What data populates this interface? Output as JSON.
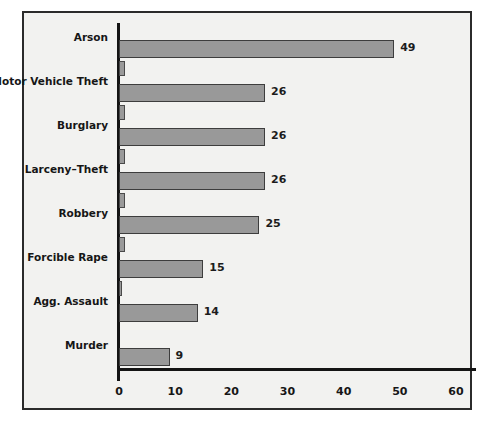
{
  "chart_data": {
    "type": "bar",
    "orientation": "horizontal",
    "title": "",
    "subtitle": "",
    "xlabel": "",
    "ylabel": "",
    "categories": [
      "Arson",
      "Motor Vehicle Theft",
      "Burglary",
      "Larceny–Theft",
      "Robbery",
      "Forcible Rape",
      "Agg. Assault",
      "Murder"
    ],
    "values": [
      49,
      26,
      26,
      26,
      25,
      15,
      14,
      9
    ],
    "value_labels": [
      "49",
      "26",
      "26",
      "26",
      "25",
      "15",
      "14",
      "9"
    ],
    "secondary_values": [
      1,
      1,
      1,
      1,
      1,
      0.5,
      0,
      0
    ],
    "xlim": [
      0,
      60
    ],
    "xticks": [
      0,
      10,
      20,
      30,
      40,
      50,
      60
    ],
    "xtick_labels": [
      "0",
      "10",
      "20",
      "30",
      "40",
      "50",
      "60"
    ],
    "grid": false,
    "legend": null,
    "colors": {
      "bar_fill": "#999999",
      "bar_edge": "#3d3d3d",
      "panel_background": "#f2f2f0",
      "panel_border": "#2b2b2b",
      "axis": "#141414",
      "text": "#161616"
    }
  }
}
